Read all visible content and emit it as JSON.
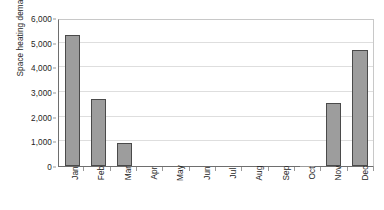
{
  "chart_data": {
    "type": "bar",
    "title": "",
    "xlabel": "",
    "ylabel": "Space heating demand (kWh)",
    "categories": [
      "Jan",
      "Feb",
      "Mar",
      "Apr",
      "May",
      "Jun",
      "Jul",
      "Aug",
      "Sep",
      "Oct",
      "Nov",
      "Dec"
    ],
    "values": [
      5330,
      2730,
      950,
      0,
      0,
      0,
      0,
      0,
      0,
      20,
      2570,
      4700
    ],
    "ylim": [
      0,
      6000
    ],
    "ytick_values": [
      0,
      1000,
      2000,
      3000,
      4000,
      5000,
      6000
    ],
    "ytick_labels": [
      "0",
      "1,000",
      "2,000",
      "3,000",
      "4,000",
      "5,000",
      "6,000"
    ],
    "grid": true,
    "legend": false,
    "legend_position": "none",
    "bar_color": "#9d9d9d",
    "bar_edge_color": "#4a4a4a",
    "gridline_color": "#dedede",
    "axis_color": "#6e6e6e",
    "text_color": "#1d1d1d"
  }
}
